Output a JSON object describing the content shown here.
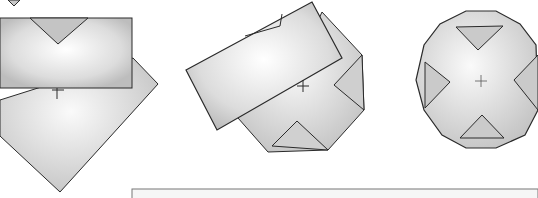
{
  "figure": {
    "colors": {
      "background": "#ffffff",
      "stroke": "#2a2a2a",
      "fill_light": "#f2f2f2",
      "fill_mid": "#d6d6d6",
      "fill_dark": "#b8b8b8"
    },
    "steps": [
      {
        "name": "step-1",
        "shape": "rectangle over diamond"
      },
      {
        "name": "step-2",
        "shape": "tilted rectangle over folded octagon"
      },
      {
        "name": "step-3",
        "shape": "round polygon with cross fold"
      }
    ],
    "caption_box": ""
  }
}
